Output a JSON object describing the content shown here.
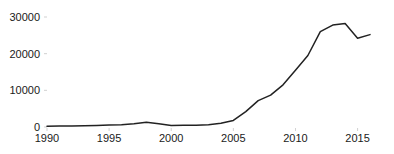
{
  "chart_data": {
    "type": "line",
    "title": "",
    "xlabel": "",
    "ylabel": "",
    "xlim": [
      1990,
      2016
    ],
    "ylim": [
      0,
      30000
    ],
    "grid": false,
    "legend": null,
    "x_ticks": [
      1990,
      1995,
      2000,
      2005,
      2010,
      2015
    ],
    "x_tick_labels": [
      "1990",
      "1995",
      "2000",
      "2005",
      "2010",
      "2015"
    ],
    "y_ticks": [
      0,
      10000,
      20000,
      30000
    ],
    "y_tick_labels": [
      "0",
      "10000",
      "20000",
      "30000"
    ],
    "series": [
      {
        "name": "series-1",
        "color": "#222222",
        "x": [
          1990,
          1991,
          1992,
          1993,
          1994,
          1995,
          1996,
          1997,
          1998,
          1999,
          2000,
          2001,
          2002,
          2003,
          2004,
          2005,
          2006,
          2007,
          2008,
          2009,
          2010,
          2011,
          2012,
          2013,
          2014,
          2015,
          2016
        ],
        "values": [
          200,
          250,
          300,
          350,
          420,
          520,
          620,
          900,
          1300,
          900,
          420,
          450,
          500,
          620,
          1000,
          1800,
          4200,
          7200,
          8700,
          11500,
          15500,
          19500,
          26000,
          27800,
          28200,
          24200,
          25200
        ]
      }
    ]
  }
}
